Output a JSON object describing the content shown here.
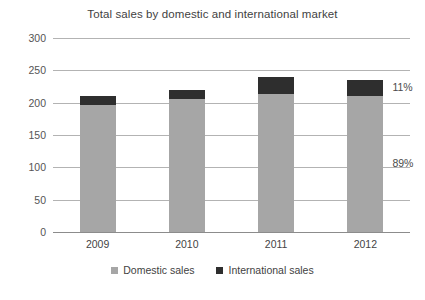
{
  "chart_data": {
    "type": "bar",
    "title": "Total sales by domestic and international market",
    "xlabel": "",
    "ylabel": "",
    "categories": [
      "2009",
      "2010",
      "2011",
      "2012"
    ],
    "series": [
      {
        "name": "Domestic sales",
        "values": [
          197,
          206,
          214,
          211
        ],
        "color": "#a6a6a6"
      },
      {
        "name": "International sales",
        "values": [
          13,
          14,
          26,
          24
        ],
        "color": "#2e2e2e"
      }
    ],
    "totals": [
      210,
      220,
      240,
      235
    ],
    "stacked": true,
    "ylim": [
      0,
      300
    ],
    "yticks": [
      300,
      250,
      200,
      150,
      100,
      50,
      0
    ],
    "ytick_labels": [
      "300",
      "250",
      "200",
      "150",
      "100",
      "50",
      "0"
    ],
    "grid": true,
    "legend_position": "bottom",
    "annotations": [
      {
        "text": "11%",
        "target": "2012 international share"
      },
      {
        "text": "89%",
        "target": "2012 domestic share"
      }
    ]
  },
  "legend": {
    "items": [
      {
        "label": "Domestic sales",
        "color": "#a6a6a6"
      },
      {
        "label": "International sales",
        "color": "#2e2e2e"
      }
    ]
  },
  "annotations": {
    "international_pct": "11%",
    "domestic_pct": "89%"
  },
  "colors": {
    "domestic": "#a6a6a6",
    "international": "#2e2e2e",
    "grid": "#b3b3b3",
    "axis": "#8c8c8c",
    "background": "#ffffff",
    "text": "#404040"
  }
}
